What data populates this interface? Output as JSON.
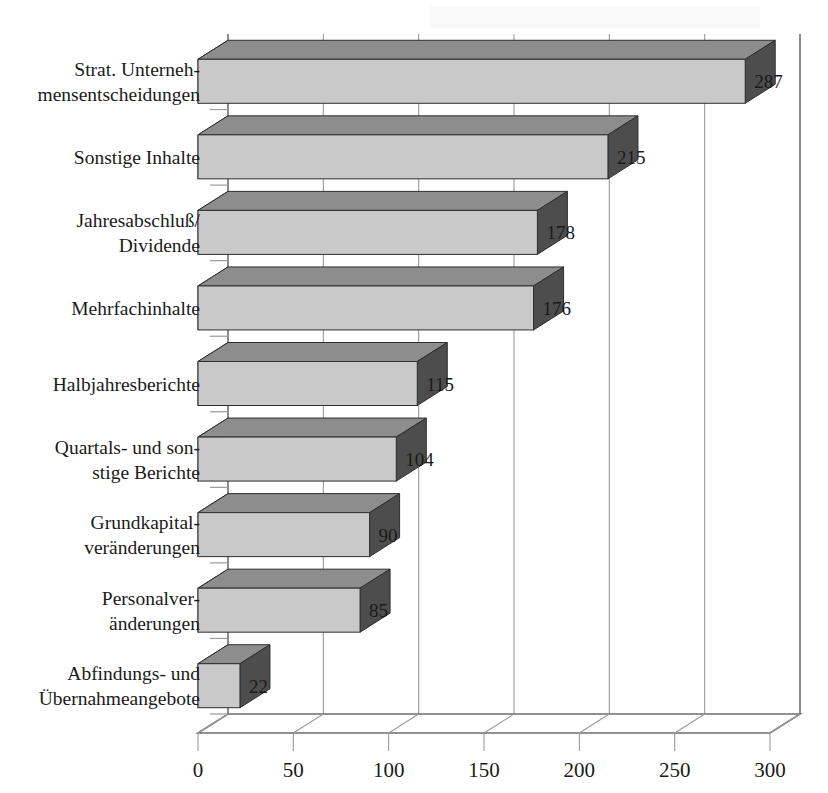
{
  "chart_data": {
    "type": "bar",
    "orientation": "horizontal",
    "style": "3d",
    "title": "",
    "subtitle": "",
    "xlabel": "",
    "ylabel": "",
    "xlim": [
      0,
      300
    ],
    "xticks": [
      0,
      50,
      100,
      150,
      200,
      250,
      300
    ],
    "xtick_labels": [
      "0",
      "50",
      "100",
      "150",
      "200",
      "250",
      "300"
    ],
    "grid": true,
    "grid_axis": "x",
    "legend": false,
    "legend_position": "none",
    "categories": [
      "Strat. Unterneh-\nmensentscheidungen",
      "Sonstige Inhalte",
      "Jahresabschluß/\nDividende",
      "Mehrfachinhalte",
      "Halbjahresberichte",
      "Quartals- und son-\nstige Berichte",
      "Grundkapital-\nveränderungen",
      "Personalver-\nänderungen",
      "Abfindungs- und\nÜbernahmeangebote"
    ],
    "values": [
      287,
      215,
      178,
      176,
      115,
      104,
      90,
      85,
      22
    ],
    "data_labels": [
      "287",
      "215",
      "178",
      "176",
      "115",
      "104",
      "90",
      "85",
      "22"
    ],
    "colors": {
      "bar_front": "#c9c9c9",
      "bar_top": "#8d8d8d",
      "bar_side": "#4d4d4d",
      "axis_line": "#6e6e6e",
      "grid_line": "#9a9a9a",
      "text": "#1a1a1a",
      "background": "#ffffff"
    }
  },
  "category_label_lines": [
    [
      "Strat. Unterneh-",
      "mensentscheidungen"
    ],
    [
      "Sonstige Inhalte"
    ],
    [
      "Jahresabschluß/",
      "Dividende"
    ],
    [
      "Mehrfachinhalte"
    ],
    [
      "Halbjahresberichte"
    ],
    [
      "Quartals- und son-",
      "stige Berichte"
    ],
    [
      "Grundkapital-",
      "veränderungen"
    ],
    [
      "Personalver-",
      "änderungen"
    ],
    [
      "Abfindungs- und",
      "Übernahmeangebote"
    ]
  ]
}
